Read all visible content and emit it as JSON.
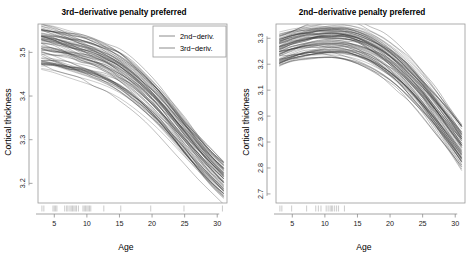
{
  "figure": {
    "width": 476,
    "height": 260,
    "background": "#ffffff",
    "panel_count": 2
  },
  "chart_data": [
    {
      "id": "left",
      "type": "line",
      "title": "3rd−derivative penalty preferred",
      "xlabel": "Age",
      "ylabel": "Cortical thickness",
      "xlim": [
        2.5,
        31.5
      ],
      "ylim": [
        3.155,
        3.565
      ],
      "xticks": [
        5,
        10,
        15,
        20,
        25,
        30
      ],
      "xtick_labels": [
        "5",
        "10",
        "15",
        "20",
        "25",
        "30"
      ],
      "yticks": [
        3.2,
        3.3,
        3.4,
        3.5
      ],
      "ytick_labels": [
        "3.2",
        "3.3",
        "3.4",
        "3.5"
      ],
      "grid": false,
      "legend": {
        "position": "top-right",
        "entries": [
          {
            "label": "2nd−deriv.",
            "color": "#8c8c8c"
          },
          {
            "label": "3rd−deriv.",
            "color": "#8c8c8c"
          }
        ]
      },
      "rug": {
        "present": true,
        "axis": "x",
        "values": [
          3.1,
          3.4,
          4.8,
          5.0,
          5.2,
          5.4,
          6.6,
          6.9,
          7.1,
          7.4,
          7.6,
          7.8,
          8.0,
          8.2,
          8.4,
          8.7,
          9.4,
          9.6,
          9.8,
          10.0,
          10.2,
          10.4,
          10.6,
          12.6,
          15.2,
          19.8,
          24.9,
          30.8
        ]
      },
      "series_note": "Two overlaid bundles of ~40 subject-specific smooth trajectories each; thickness declines monotonically with age, steepening after ~15 and fanning out toward age 31.",
      "series": [
        {
          "name": "2nd−deriv.",
          "color": "#6e6e6e",
          "n_curves": 38,
          "x": [
            3,
            5,
            7,
            9,
            11,
            13,
            15,
            17,
            19,
            21,
            23,
            25,
            27,
            29,
            31
          ],
          "mean_values": [
            3.508,
            3.503,
            3.495,
            3.487,
            3.478,
            3.466,
            3.45,
            3.428,
            3.402,
            3.372,
            3.338,
            3.302,
            3.267,
            3.234,
            3.205
          ],
          "spread_at_start": 0.075,
          "spread_at_end": 0.052
        },
        {
          "name": "3rd−deriv.",
          "color": "#2f2f2f",
          "n_curves": 38,
          "x": [
            3,
            5,
            7,
            9,
            11,
            13,
            15,
            17,
            19,
            21,
            23,
            25,
            27,
            29,
            31
          ],
          "mean_values": [
            3.512,
            3.506,
            3.498,
            3.489,
            3.479,
            3.466,
            3.449,
            3.427,
            3.4,
            3.37,
            3.336,
            3.3,
            3.265,
            3.232,
            3.203
          ],
          "spread_at_start": 0.08,
          "spread_at_end": 0.055
        }
      ]
    },
    {
      "id": "right",
      "type": "line",
      "title": "2nd−derivative penalty preferred",
      "xlabel": "Age",
      "ylabel": "Cortical thickness",
      "xlim": [
        2.5,
        31.5
      ],
      "ylim": [
        2.665,
        3.355
      ],
      "xticks": [
        5,
        10,
        15,
        20,
        25,
        30
      ],
      "xtick_labels": [
        "5",
        "10",
        "15",
        "20",
        "25",
        "30"
      ],
      "yticks": [
        2.7,
        2.8,
        2.9,
        3.0,
        3.1,
        3.2,
        3.3
      ],
      "ytick_labels": [
        "2.7",
        "2.8",
        "2.9",
        "3.0",
        "3.1",
        "3.2",
        "3.3"
      ],
      "grid": false,
      "legend": {
        "position": "none",
        "entries": []
      },
      "rug": {
        "present": true,
        "axis": "x",
        "values": [
          3.1,
          3.4,
          4.9,
          7.2,
          8.6,
          9.0,
          9.4,
          10.2,
          10.5,
          10.8,
          11.0,
          11.2,
          11.5,
          11.8,
          12.1,
          13.0
        ]
      },
      "series_note": "Two overlaid bundles of ~40 subject-specific smooth trajectories each; thickness rises to a peak near age 11–13 then declines steeply, fanning out toward age 31.",
      "series": [
        {
          "name": "2nd−deriv.",
          "color": "#6e6e6e",
          "n_curves": 38,
          "x": [
            3,
            5,
            7,
            9,
            11,
            13,
            15,
            17,
            19,
            21,
            23,
            25,
            27,
            29,
            31
          ],
          "mean_values": [
            3.255,
            3.272,
            3.284,
            3.291,
            3.293,
            3.289,
            3.277,
            3.256,
            3.226,
            3.187,
            3.139,
            3.083,
            3.02,
            2.953,
            2.884
          ],
          "spread_at_start": 0.09,
          "spread_at_end": 0.11
        },
        {
          "name": "3rd−deriv.",
          "color": "#2f2f2f",
          "n_curves": 38,
          "x": [
            3,
            5,
            7,
            9,
            11,
            13,
            15,
            17,
            19,
            21,
            23,
            25,
            27,
            29,
            31
          ],
          "mean_values": [
            3.258,
            3.274,
            3.286,
            3.292,
            3.294,
            3.29,
            3.277,
            3.255,
            3.224,
            3.185,
            3.137,
            3.081,
            3.018,
            2.951,
            2.882
          ],
          "spread_at_start": 0.095,
          "spread_at_end": 0.115
        }
      ]
    }
  ]
}
